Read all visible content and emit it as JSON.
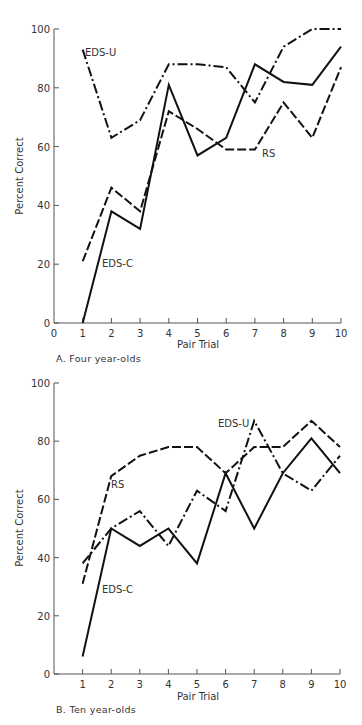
{
  "chart_data": [
    {
      "type": "line",
      "panel": "A",
      "caption": "A. Four year-olds",
      "xlabel": "Pair Trial",
      "ylabel": "Percent Correct",
      "x": [
        1,
        2,
        3,
        4,
        5,
        6,
        7,
        8,
        9,
        10
      ],
      "x_ticks": [
        "0",
        "1",
        "2",
        "3",
        "4",
        "5",
        "6",
        "7",
        "8",
        "9",
        "10"
      ],
      "y_ticks": [
        "0",
        "20",
        "40",
        "60",
        "80",
        "100"
      ],
      "ylim": [
        0,
        100
      ],
      "xlim": [
        0,
        10
      ],
      "grid": false,
      "legend": "inline labels",
      "series": [
        {
          "name": "EDS-U",
          "style": "dash-dot",
          "values": [
            93,
            63,
            69,
            88,
            88,
            87,
            75,
            94,
            100,
            100
          ]
        },
        {
          "name": "EDS-C",
          "style": "solid",
          "values": [
            0,
            38,
            32,
            81,
            57,
            63,
            88,
            82,
            81,
            94
          ]
        },
        {
          "name": "RS",
          "style": "dashed",
          "values": [
            21,
            46,
            38,
            72,
            66,
            59,
            59,
            75,
            63,
            87
          ]
        }
      ]
    },
    {
      "type": "line",
      "panel": "B",
      "caption": "B. Ten year-olds",
      "xlabel": "Pair Trial",
      "ylabel": "Percent Correct",
      "x": [
        1,
        2,
        3,
        4,
        5,
        6,
        7,
        8,
        9,
        10
      ],
      "x_ticks": [
        "1",
        "2",
        "3",
        "4",
        "5",
        "6",
        "7",
        "8",
        "9",
        "10"
      ],
      "y_ticks": [
        "0",
        "20",
        "40",
        "60",
        "80",
        "100"
      ],
      "ylim": [
        0,
        100
      ],
      "xlim": [
        0,
        10
      ],
      "grid": false,
      "legend": "inline labels",
      "series": [
        {
          "name": "EDS-U",
          "style": "dash-dot",
          "values": [
            38,
            50,
            56,
            44,
            63,
            56,
            87,
            69,
            63,
            75
          ]
        },
        {
          "name": "EDS-C",
          "style": "solid",
          "values": [
            6,
            50,
            44,
            50,
            38,
            69,
            50,
            69,
            81,
            69
          ]
        },
        {
          "name": "RS",
          "style": "dashed",
          "values": [
            31,
            68,
            75,
            78,
            78,
            69,
            78,
            78,
            87,
            78
          ]
        }
      ]
    }
  ],
  "panels": {
    "a": {
      "caption": "A. Four year-olds",
      "xlabel": "Pair Trial",
      "ylabel": "Percent Correct",
      "labels": {
        "eds_u": "EDS-U",
        "eds_c": "EDS-C",
        "rs": "RS"
      },
      "x_ticks": [
        "0",
        "1",
        "2",
        "3",
        "4",
        "5",
        "6",
        "7",
        "8",
        "9",
        "10"
      ],
      "y_ticks": [
        "0",
        "20",
        "40",
        "60",
        "80",
        "100"
      ]
    },
    "b": {
      "caption": "B. Ten year-olds",
      "xlabel": "Pair Trial",
      "ylabel": "Percent Correct",
      "labels": {
        "eds_u": "EDS-U",
        "eds_c": "EDS-C",
        "rs": "RS"
      },
      "x_ticks": [
        "1",
        "2",
        "3",
        "4",
        "5",
        "6",
        "7",
        "8",
        "9",
        "10"
      ],
      "y_ticks": [
        "0",
        "20",
        "40",
        "60",
        "80",
        "100"
      ]
    }
  },
  "colors": {
    "line": "#111111",
    "axis": "#555555",
    "text": "#333333",
    "background": "#ffffff"
  }
}
